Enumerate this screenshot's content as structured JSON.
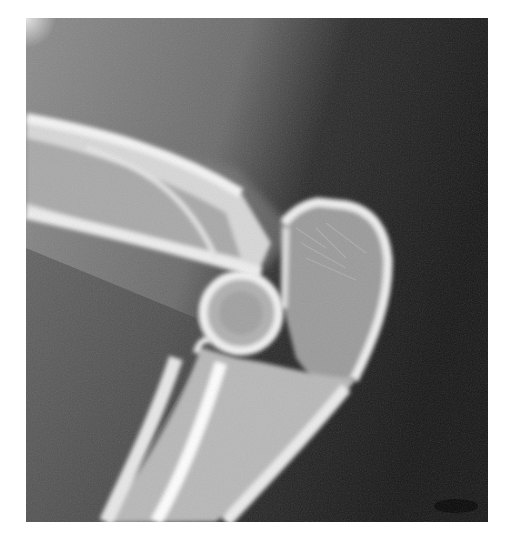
{
  "image": {
    "kind": "radiograph",
    "subject": "elbow lateral view",
    "background_color": "#ffffff",
    "frame": {
      "x": 26,
      "y": 18,
      "width": 462,
      "height": 504
    },
    "colors": {
      "soft_tissue_light": "#8a8a8a",
      "soft_tissue_mid": "#5e5e5e",
      "air_dark": "#1c1c1c",
      "bone_cortex": "#f2f2f2",
      "bone_marrow": "#b5b5b5"
    }
  }
}
